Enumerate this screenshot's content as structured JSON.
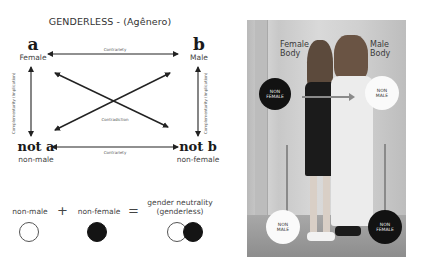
{
  "diagram": {
    "title": "GENDERLESS - (Agênero)",
    "corners": {
      "top_left": {
        "letter": "a",
        "label": "Female"
      },
      "top_right": {
        "letter": "b",
        "label": "Male"
      },
      "bottom_left": {
        "letter": "not a",
        "label": "non-male"
      },
      "bottom_right": {
        "letter": "not b",
        "label": "non-female"
      }
    },
    "relations": {
      "top": "Contrariety",
      "bottom": "Contrariety",
      "diagonal": "Contradiction",
      "left": "Complementarity (Implication)",
      "right": "Complementarity (Implication)"
    }
  },
  "equation": {
    "term1": "non-male",
    "plus": "+",
    "term2": "non-female",
    "equals": "=",
    "result_line1": "gender neutrality",
    "result_line2": "(genderless)",
    "symbols": [
      "white-circle",
      "black-circle",
      "white-and-black-circles"
    ]
  },
  "photo": {
    "female_label_line1": "Female",
    "female_label_line2": "Body",
    "male_label_line1": "Male",
    "male_label_line2": "Body",
    "circles": [
      {
        "line1": "NON",
        "line2": "FEMALE",
        "color": "black",
        "position": "upper-left"
      },
      {
        "line1": "NON",
        "line2": "MALE",
        "color": "white",
        "position": "upper-right"
      },
      {
        "line1": "NON",
        "line2": "MALE",
        "color": "white",
        "position": "lower-left"
      },
      {
        "line1": "NON",
        "line2": "FEMALE",
        "color": "black",
        "position": "lower-right"
      }
    ]
  },
  "colors": {
    "ink": "#1a1a1a",
    "text": "#444444",
    "black_circle": "#141414",
    "arrow_gray": "#8a8a8a"
  }
}
